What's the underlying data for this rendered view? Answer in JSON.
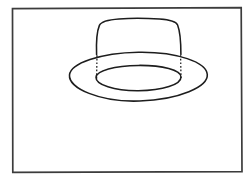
{
  "image": {
    "title": "Line drawing of a hat",
    "width": 247,
    "height": 180,
    "background_color": "#ffffff",
    "ink_color": "#1a1a1a",
    "style": "hand-drawn black ink line art, no fill"
  },
  "frame": {
    "name": "border-rectangle",
    "x": 12,
    "y": 8,
    "width": 230,
    "height": 164,
    "stroke_color": "#3a3a3a",
    "stroke_width": 1.6,
    "fill": "none"
  },
  "subject": {
    "name": "hat",
    "description": "A brimmed hat drawn in perspective: a rounded crown sitting on an elliptical brim, with the hidden crown sides shown as dotted lines.",
    "parts": [
      {
        "name": "crown",
        "description": "Rounded tapered crown with curved top arc and slightly flared sides",
        "top_arc_left_x": 98,
        "top_arc_right_x": 178,
        "top_arc_peak_y": 20,
        "bottom_left_x": 96,
        "bottom_right_x": 181,
        "bottom_y": 54,
        "stroke_width": 1.5
      },
      {
        "name": "brim-outer-ellipse",
        "center_x": 138,
        "center_y": 77,
        "radius_x": 69,
        "radius_y": 25,
        "stroke_width": 1.5
      },
      {
        "name": "brim-inner-ellipse",
        "center_x": 138,
        "center_y": 78,
        "radius_x": 43,
        "radius_y": 13,
        "stroke_width": 1.5
      },
      {
        "name": "hidden-edge-left",
        "description": "Dotted vertical line from crown base to inner brim ellipse",
        "x": 97,
        "y_top": 55,
        "y_bottom": 78,
        "dash_pattern": "1.6 1.8"
      },
      {
        "name": "hidden-edge-right",
        "description": "Dotted vertical line from crown base to inner brim ellipse",
        "x": 180,
        "y_top": 55,
        "y_bottom": 78,
        "dash_pattern": "1.6 1.8"
      }
    ]
  }
}
